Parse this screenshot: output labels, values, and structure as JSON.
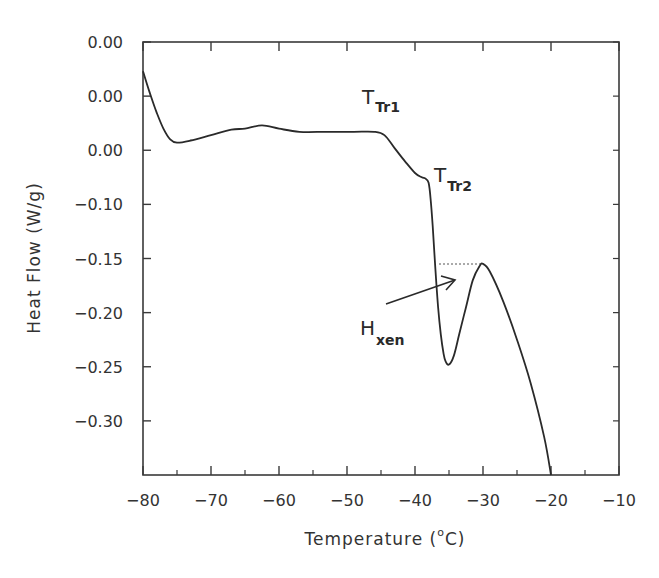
{
  "chart_data": {
    "type": "line",
    "title": "",
    "xlabel": "Temperature (°C)",
    "xlabel_parts": {
      "prefix": "Temperature (",
      "degree": "o",
      "suffix": "C)"
    },
    "ylabel": "Heat Flow (W/g)",
    "xlim": [
      -80,
      -10
    ],
    "ylim": [
      -0.35,
      0.05
    ],
    "grid": false,
    "legend": null,
    "x_ticks": [
      -80,
      -70,
      -60,
      -50,
      -40,
      -30,
      -20,
      -10
    ],
    "x_tick_labels": [
      "−80",
      "−70",
      "−60",
      "−50",
      "−40",
      "−30",
      "−20",
      "−10"
    ],
    "y_ticks": [
      0.05,
      0.0,
      -0.05,
      -0.1,
      -0.15,
      -0.2,
      -0.25,
      -0.3
    ],
    "y_tick_labels": [
      "0.00",
      "0.00",
      "0.00",
      "−0.10",
      "−0.15",
      "−0.20",
      "−0.25",
      "−0.30"
    ],
    "series": [
      {
        "name": "DSC heating curve",
        "x": [
          -80.0,
          -79.0,
          -78.0,
          -77.0,
          -76.0,
          -75.0,
          -73.0,
          -70.0,
          -67.0,
          -65.0,
          -62.5,
          -60.0,
          -57.0,
          -53.0,
          -49.0,
          -46.0,
          -44.5,
          -43.0,
          -41.5,
          -40.0,
          -39.0,
          -38.5,
          -38.0,
          -37.7,
          -37.4,
          -37.0,
          -36.6,
          -36.2,
          -35.8,
          -35.5,
          -35.0,
          -34.3,
          -33.5,
          -32.5,
          -31.5,
          -30.5,
          -30.0,
          -29.0,
          -27.0,
          -25.0,
          -23.0,
          -21.0,
          -20.0
        ],
        "y": [
          0.023,
          0.003,
          -0.015,
          -0.03,
          -0.04,
          -0.043,
          -0.041,
          -0.036,
          -0.031,
          -0.03,
          -0.027,
          -0.03,
          -0.033,
          -0.033,
          -0.033,
          -0.033,
          -0.036,
          -0.048,
          -0.06,
          -0.071,
          -0.075,
          -0.076,
          -0.08,
          -0.095,
          -0.12,
          -0.16,
          -0.195,
          -0.22,
          -0.238,
          -0.245,
          -0.248,
          -0.24,
          -0.22,
          -0.195,
          -0.17,
          -0.157,
          -0.155,
          -0.162,
          -0.19,
          -0.225,
          -0.265,
          -0.315,
          -0.35
        ]
      }
    ],
    "annotations": [
      {
        "text": "T",
        "subscript": "Tr1",
        "x": -45.5,
        "y": -0.012
      },
      {
        "text": "T",
        "subscript": "Tr2",
        "x": -37.5,
        "y": -0.068
      },
      {
        "text": "H",
        "subscript": "xen",
        "x": -41.5,
        "y": -0.215,
        "arrow_to": [
          -34.5,
          -0.18
        ]
      },
      {
        "type": "dotted-line",
        "from": [
          -37.2,
          -0.155
        ],
        "to": [
          -31.0,
          -0.155
        ]
      }
    ]
  },
  "labels": {
    "y_axis_title": "Heat Flow (W/g)",
    "x_axis_prefix": "Temperature (",
    "x_axis_degree": "o",
    "x_axis_suffix": "C)",
    "ttr1_main": "T",
    "ttr1_sub": "Tr1",
    "ttr2_main": "T",
    "ttr2_sub": "Tr2",
    "hxen_main": "H",
    "hxen_sub": "xen"
  },
  "colors": {
    "line": "#2a2a2a",
    "axis": "#3a3a3a",
    "background": "#ffffff"
  }
}
